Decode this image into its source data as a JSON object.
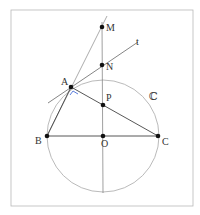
{
  "diagram": {
    "frame": {
      "x": 11,
      "y": 10,
      "w": 182,
      "h": 196,
      "stroke": "#b0b0b0"
    },
    "circle": {
      "label": "ℂ",
      "cx": 103,
      "cy": 136,
      "r": 56,
      "stroke": "#a8a8a8"
    },
    "points": [
      {
        "name": "M",
        "label": "M",
        "x": 102,
        "y": 27
      },
      {
        "name": "N",
        "label": "N",
        "x": 102,
        "y": 65
      },
      {
        "name": "A",
        "label": "A",
        "x": 71,
        "y": 87
      },
      {
        "name": "P",
        "label": "P",
        "x": 103,
        "y": 105
      },
      {
        "name": "B",
        "label": "B",
        "x": 47,
        "y": 136
      },
      {
        "name": "O",
        "label": "O",
        "x": 103,
        "y": 136
      },
      {
        "name": "C",
        "label": "C",
        "x": 158,
        "y": 136
      }
    ],
    "tangent_label": "t",
    "right_angle_color": "#4a6fd8",
    "line_color": "#555555"
  }
}
